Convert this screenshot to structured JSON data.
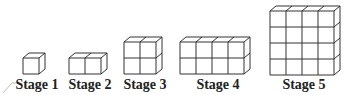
{
  "figure": {
    "stroke_color": "#333333",
    "stages": [
      {
        "label": "Stage 1",
        "cols": 1,
        "rows": 1,
        "x": 23,
        "y_bottom": 74,
        "label_cx": 37
      },
      {
        "label": "Stage 2",
        "cols": 2,
        "rows": 1,
        "x": 69,
        "y_bottom": 74,
        "label_cx": 90
      },
      {
        "label": "Stage 3",
        "cols": 2,
        "rows": 2,
        "x": 124,
        "y_bottom": 74,
        "label_cx": 145
      },
      {
        "label": "Stage 4",
        "cols": 4,
        "rows": 2,
        "x": 180,
        "y_bottom": 74,
        "label_cx": 218
      },
      {
        "label": "Stage 5",
        "cols": 4,
        "rows": 4,
        "x": 270,
        "y_bottom": 75,
        "label_cx": 304
      }
    ]
  }
}
